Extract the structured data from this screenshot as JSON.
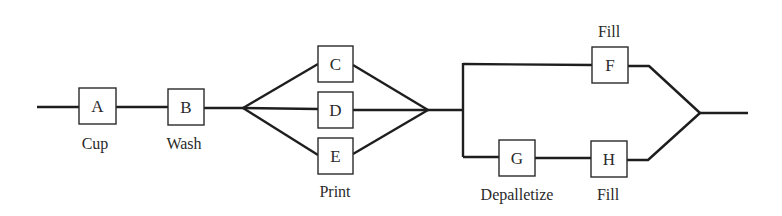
{
  "diagram": {
    "type": "process-flow",
    "nodes": {
      "A": {
        "label": "A",
        "caption": "Cup"
      },
      "B": {
        "label": "B",
        "caption": "Wash"
      },
      "C": {
        "label": "C"
      },
      "D": {
        "label": "D"
      },
      "E": {
        "label": "E"
      },
      "F": {
        "label": "F",
        "caption": "Fill"
      },
      "G": {
        "label": "G",
        "caption": "Depalletize"
      },
      "H": {
        "label": "H",
        "caption": "Fill"
      }
    },
    "group_captions": {
      "print": "Print"
    },
    "edges": [
      [
        "start",
        "A"
      ],
      [
        "A",
        "B"
      ],
      [
        "B",
        "C"
      ],
      [
        "B",
        "D"
      ],
      [
        "B",
        "E"
      ],
      [
        "C",
        "F"
      ],
      [
        "D",
        "F"
      ],
      [
        "E",
        "F"
      ],
      [
        "C",
        "G"
      ],
      [
        "D",
        "G"
      ],
      [
        "E",
        "G"
      ],
      [
        "G",
        "H"
      ],
      [
        "F",
        "end"
      ],
      [
        "H",
        "end"
      ]
    ],
    "colors": {
      "line": "#1e1e1e",
      "box_border": "#2a2a2a",
      "text": "#2a2a2a",
      "background": "#ffffff"
    }
  }
}
